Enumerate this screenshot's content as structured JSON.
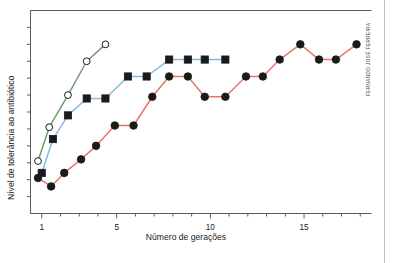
{
  "figure": {
    "credit": "FERNANDO JOSÉ FERREIRA",
    "background_color": "#ffffff",
    "frame_color": "#5a5a5a"
  },
  "chart_data": {
    "type": "line",
    "title": "",
    "xlabel": "Número de gerações",
    "ylabel": "Nível de tolerância ao antibiótico",
    "xlim": [
      0.4,
      18.6
    ],
    "ylim": [
      0,
      12
    ],
    "xticks": [
      1,
      5,
      10,
      15
    ],
    "xticklabels": [
      "1",
      "5",
      "10",
      "15"
    ],
    "xminorticks": [
      2,
      3,
      4,
      6,
      7,
      8,
      9,
      11,
      12,
      13,
      14,
      16,
      17,
      18
    ],
    "yticks": [
      1,
      2,
      3,
      4,
      5,
      6,
      7,
      8,
      9,
      10,
      11
    ],
    "yticklabels": [],
    "grid": false,
    "legend": false,
    "series": [
      {
        "name": "green-open-circle-series",
        "color": "#6f9b6d",
        "marker": "open-circle",
        "marker_fill": "#ffffff",
        "x": [
          0.8,
          1.4,
          2.4,
          3.4,
          4.4
        ],
        "y": [
          3.1,
          5.1,
          7.0,
          9.0,
          10.0
        ]
      },
      {
        "name": "blue-filled-square-series",
        "color": "#85bcdf",
        "marker": "filled-square",
        "marker_fill": "#1a1a1a",
        "x": [
          1.0,
          1.6,
          2.4,
          3.4,
          4.4,
          5.6,
          6.6,
          7.8,
          8.8,
          9.7,
          10.8
        ],
        "y": [
          2.4,
          4.4,
          5.8,
          6.8,
          6.8,
          8.1,
          8.1,
          9.1,
          9.1,
          9.1,
          9.1
        ]
      },
      {
        "name": "red-filled-circle-series",
        "color": "#e8776a",
        "marker": "filled-circle",
        "marker_fill": "#1a1a1a",
        "x": [
          0.8,
          1.5,
          2.2,
          3.1,
          3.9,
          4.9,
          5.9,
          6.9,
          7.8,
          8.8,
          9.7,
          10.8,
          11.9,
          12.8,
          13.7,
          14.8,
          15.8,
          16.7,
          17.8
        ],
        "y": [
          2.1,
          1.6,
          2.4,
          3.2,
          4.0,
          5.2,
          5.2,
          6.9,
          8.1,
          8.1,
          6.9,
          6.9,
          8.1,
          8.1,
          9.1,
          10.0,
          9.1,
          9.1,
          10.0
        ]
      }
    ]
  }
}
